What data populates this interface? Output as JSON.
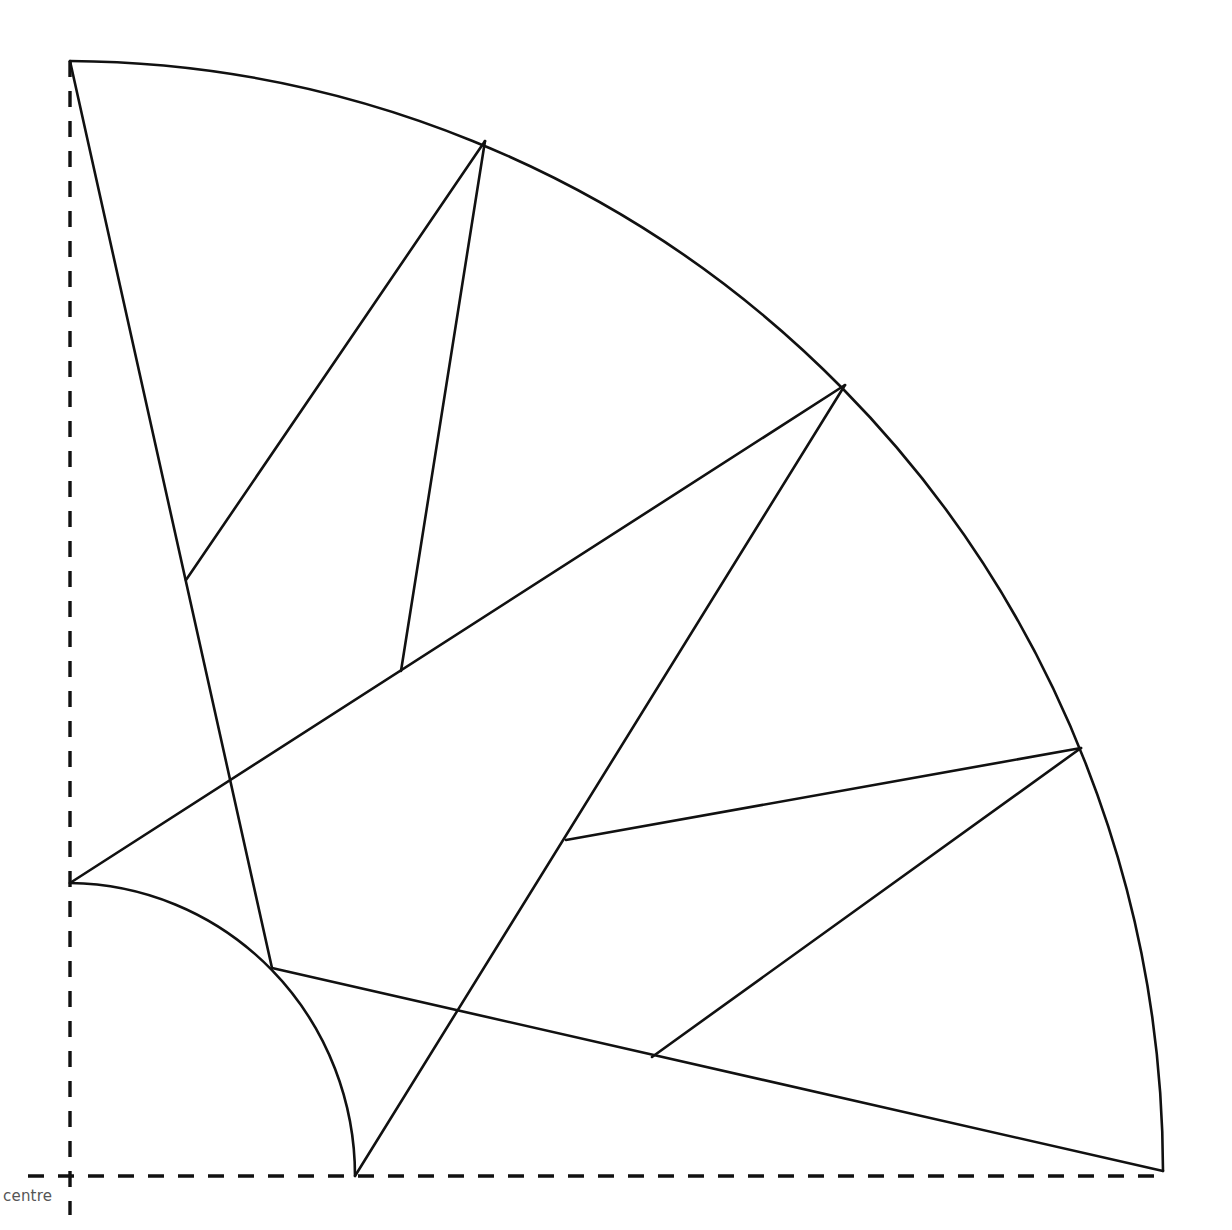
{
  "diagram": {
    "type": "geometric-construction",
    "colors": {
      "stroke": "#111111",
      "background": "#ffffff",
      "label": "#555555"
    },
    "centre": {
      "x": 70,
      "y": 1176
    },
    "labels": {
      "centre": "centre"
    },
    "outer_arc": {
      "radius": 1093,
      "start": {
        "x": 70,
        "y": 61
      },
      "end": {
        "x": 1163,
        "y": 1171
      }
    },
    "inner_arc": {
      "radius": 285,
      "start": {
        "x": 70,
        "y": 883
      },
      "end": {
        "x": 355,
        "y": 1176
      }
    },
    "axes": {
      "vertical": {
        "x": 70,
        "y1": 61,
        "y2": 1215
      },
      "horizontal": {
        "y": 1176,
        "x1": 28,
        "x2": 1163
      }
    },
    "segments": [
      {
        "id": "top-to-inner",
        "x1": 70,
        "y1": 61,
        "x2": 272,
        "y2": 968
      },
      {
        "id": "left-apex-a",
        "x1": 186,
        "y1": 580,
        "x2": 485,
        "y2": 141
      },
      {
        "id": "left-apex-b",
        "x1": 485,
        "y1": 141,
        "x2": 401,
        "y2": 671
      },
      {
        "id": "long-diagonal",
        "x1": 70,
        "y1": 883,
        "x2": 845,
        "y2": 385
      },
      {
        "id": "steep-diagonal",
        "x1": 845,
        "y1": 385,
        "x2": 355,
        "y2": 1176
      },
      {
        "id": "right-upper",
        "x1": 566,
        "y1": 840,
        "x2": 1081,
        "y2": 748
      },
      {
        "id": "right-lower",
        "x1": 1081,
        "y1": 748,
        "x2": 652,
        "y2": 1057
      },
      {
        "id": "bottom-chord",
        "x1": 272,
        "y1": 968,
        "x2": 1163,
        "y2": 1171
      }
    ]
  }
}
